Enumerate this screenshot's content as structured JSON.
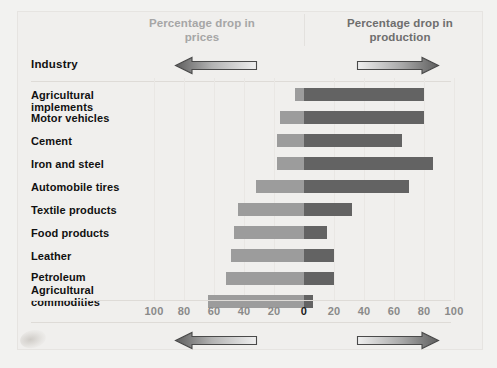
{
  "figure": {
    "background_color": "#f0efed",
    "label_column_header": "Industry"
  },
  "headers": {
    "left": "Percentage\ndrop in prices",
    "right": "Percentage\ndrop in production",
    "left_color": "#a6a6a6",
    "right_color": "#6e6e6e"
  },
  "arrows": {
    "left_icon": "arrow-left-icon",
    "right_icon": "arrow-right-icon"
  },
  "axis": {
    "ticks": [
      "100",
      "80",
      "60",
      "40",
      "20",
      "0",
      "20",
      "40",
      "60",
      "80",
      "100"
    ],
    "zero_index": 5,
    "unit": "percent",
    "range_left": 100,
    "range_right": 100
  },
  "chart_data": {
    "type": "bar",
    "orientation": "horizontal",
    "style": "diverging-bidirectional",
    "title": "",
    "subtitle": "",
    "xlabel": "",
    "ylabel": "Industry",
    "grid": true,
    "legend_position": "top",
    "xlim": [
      -100,
      100
    ],
    "axis_ticks": [
      "100",
      "80",
      "60",
      "40",
      "20",
      "0",
      "20",
      "40",
      "60",
      "80",
      "100"
    ],
    "categories": [
      "Agricultural implements",
      "Motor vehicles",
      "Cement",
      "Iron and steel",
      "Automobile tires",
      "Textile products",
      "Food products",
      "Leather",
      "Petroleum",
      "Agricultural commodities"
    ],
    "series": [
      {
        "name": "Percentage drop in prices",
        "direction": "left",
        "color": "#9c9c9c",
        "values": [
          6,
          16,
          18,
          18,
          32,
          44,
          47,
          49,
          52,
          64
        ]
      },
      {
        "name": "Percentage drop in production",
        "direction": "right",
        "color": "#636363",
        "values": [
          80,
          80,
          65,
          86,
          70,
          32,
          15,
          20,
          20,
          6
        ]
      }
    ]
  },
  "rows": [
    {
      "label": "Agricultural\nimplements",
      "prices": 6,
      "production": 80
    },
    {
      "label": "Motor vehicles",
      "prices": 16,
      "production": 80
    },
    {
      "label": "Cement",
      "prices": 18,
      "production": 65
    },
    {
      "label": "Iron and steel",
      "prices": 18,
      "production": 86
    },
    {
      "label": "Automobile tires",
      "prices": 32,
      "production": 70
    },
    {
      "label": "Textile products",
      "prices": 44,
      "production": 32
    },
    {
      "label": "Food products",
      "prices": 47,
      "production": 15
    },
    {
      "label": "Leather",
      "prices": 49,
      "production": 20
    },
    {
      "label": "Petroleum",
      "prices": 52,
      "production": 20
    },
    {
      "label": "Agricultural\ncommodities",
      "prices": 64,
      "production": 6
    }
  ]
}
